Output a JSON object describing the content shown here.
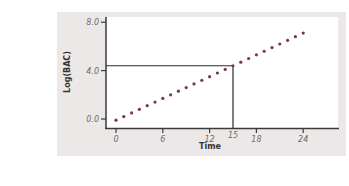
{
  "chart_data": {
    "type": "scatter",
    "title": "",
    "xlabel": "Time",
    "ylabel": "Log(BAC)",
    "x_ticks": [
      0,
      6,
      12,
      15,
      18,
      24
    ],
    "x_tick_labels": [
      "0",
      "6",
      "12",
      "15",
      "18",
      "24"
    ],
    "y_ticks": [
      0.0,
      4.0,
      8.0
    ],
    "y_tick_labels": [
      "0.0",
      "4.0",
      "8.0"
    ],
    "xlim": [
      -0.3,
      28
    ],
    "ylim": [
      -0.9,
      8.2
    ],
    "grid": false,
    "legend": null,
    "series": [
      {
        "name": "Log(BAC)",
        "style": "dotted",
        "color": "#7a3a3a",
        "x": [
          0,
          1,
          2,
          3,
          4,
          5,
          6,
          7,
          8,
          9,
          10,
          11,
          12,
          13,
          14,
          15,
          16,
          17,
          18,
          19,
          20,
          21,
          22,
          23,
          24
        ],
        "y": [
          -0.1,
          0.2,
          0.5,
          0.8,
          1.1,
          1.4,
          1.7,
          2.0,
          2.3,
          2.6,
          2.9,
          3.2,
          3.5,
          3.8,
          4.1,
          4.4,
          4.7,
          5.0,
          5.3,
          5.6,
          5.9,
          6.2,
          6.5,
          6.8,
          7.1
        ]
      }
    ],
    "annotations": [
      {
        "type": "vertical-line",
        "x": 15,
        "from_y": -0.9,
        "to_y": 4.4
      },
      {
        "type": "horizontal-line",
        "y": 4.4,
        "from_x": -0.3,
        "to_x": 15
      }
    ]
  }
}
